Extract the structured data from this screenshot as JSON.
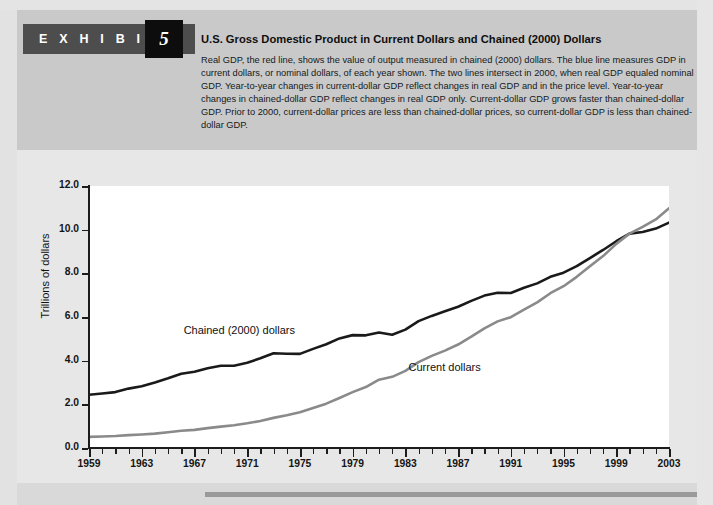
{
  "exhibit": {
    "label": "E X H I B I T",
    "number": "5"
  },
  "header": {
    "title": "U.S. Gross Domestic Product in Current Dollars and Chained (2000) Dollars",
    "caption": "Real GDP, the red line, shows the value of output measured in chained (2000) dollars. The blue line measures GDP in current dollars, or nominal dollars, of each year shown. The two lines intersect in 2000, when real GDP equaled nominal GDP. Year-to-year changes in current-dollar GDP reflect changes in real GDP and in the price level. Year-to-year changes in chained-dollar GDP reflect changes in real GDP only. Current-dollar GDP grows faster than chained-dollar GDP. Prior to 2000, current-dollar prices are less than chained-dollar prices, so current-dollar GDP is less than chained-dollar GDP."
  },
  "colors": {
    "chained_line": "#1a1a1a",
    "current_line": "#8a8a8a",
    "header_band": "#c9c9c9",
    "chart_bg": "#e7e7e7",
    "plot_bg": "#ffffff",
    "badge_bar": "#4d4d4d",
    "badge_box": "#0d0d0d",
    "rule": "#9a9a9a"
  },
  "chart_data": {
    "type": "line",
    "title": "U.S. Gross Domestic Product in Current Dollars and Chained (2000) Dollars",
    "xlabel": "",
    "ylabel": "Trillions of dollars",
    "ylim": [
      0.0,
      12.0
    ],
    "xlim": [
      1959,
      2003
    ],
    "yticks": [
      "0.0",
      "2.0",
      "4.0",
      "6.0",
      "8.0",
      "10.0",
      "12.0"
    ],
    "ytick_values": [
      0.0,
      2.0,
      4.0,
      6.0,
      8.0,
      10.0,
      12.0
    ],
    "xticks": [
      "1959",
      "1963",
      "1967",
      "1971",
      "1975",
      "1979",
      "1983",
      "1987",
      "1991",
      "1995",
      "1999",
      "2003"
    ],
    "xtick_values": [
      1959,
      1963,
      1967,
      1971,
      1975,
      1979,
      1983,
      1987,
      1991,
      1995,
      1999,
      2003
    ],
    "minor_tick_step": 1,
    "grid": false,
    "legend": "inline-labels",
    "x": [
      1959,
      1960,
      1961,
      1962,
      1963,
      1964,
      1965,
      1966,
      1967,
      1968,
      1969,
      1970,
      1971,
      1972,
      1973,
      1974,
      1975,
      1976,
      1977,
      1978,
      1979,
      1980,
      1981,
      1982,
      1983,
      1984,
      1985,
      1986,
      1987,
      1988,
      1989,
      1990,
      1991,
      1992,
      1993,
      1994,
      1995,
      1996,
      1997,
      1998,
      1999,
      2000,
      2001,
      2002,
      2003
    ],
    "series": [
      {
        "name": "Chained (2000) dollars",
        "color": "#1a1a1a",
        "label_x": 1968,
        "label_y": 5.3,
        "values": [
          2.44,
          2.5,
          2.56,
          2.72,
          2.83,
          3.0,
          3.19,
          3.4,
          3.49,
          3.65,
          3.77,
          3.77,
          3.9,
          4.11,
          4.34,
          4.32,
          4.31,
          4.54,
          4.75,
          5.02,
          5.17,
          5.16,
          5.29,
          5.19,
          5.42,
          5.81,
          6.05,
          6.26,
          6.47,
          6.74,
          6.98,
          7.11,
          7.1,
          7.34,
          7.54,
          7.84,
          8.03,
          8.33,
          8.7,
          9.07,
          9.47,
          9.82,
          9.89,
          10.05,
          10.32
        ]
      },
      {
        "name": "Current dollars",
        "color": "#8a8a8a",
        "label_x": 1984,
        "label_y": 3.6,
        "values": [
          0.51,
          0.53,
          0.55,
          0.59,
          0.62,
          0.66,
          0.72,
          0.79,
          0.83,
          0.91,
          0.98,
          1.04,
          1.13,
          1.24,
          1.38,
          1.5,
          1.64,
          1.83,
          2.03,
          2.29,
          2.56,
          2.79,
          3.13,
          3.26,
          3.53,
          3.93,
          4.22,
          4.46,
          4.74,
          5.1,
          5.48,
          5.8,
          5.99,
          6.34,
          6.67,
          7.09,
          7.41,
          7.84,
          8.32,
          8.79,
          9.35,
          9.82,
          10.13,
          10.47,
          10.98
        ]
      }
    ],
    "annotations": [
      {
        "text": "Chained (2000) dollars",
        "series": "Chained (2000) dollars"
      },
      {
        "text": "Current dollars",
        "series": "Current dollars"
      }
    ]
  }
}
